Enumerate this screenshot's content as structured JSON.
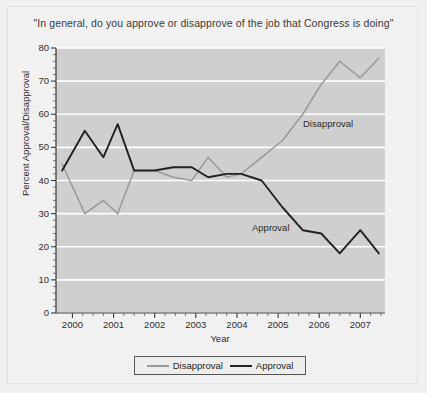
{
  "figure": {
    "background_color": "#f0f0f0",
    "plot_background_color": "#cfcfcf",
    "frame_border_color": "#e2e2e2"
  },
  "chart_data": {
    "type": "line",
    "title": "\"In general, do you approve or disapprove of the job that Congress is doing\"",
    "xlabel": "Year",
    "ylabel": "Percent Approval/Disapproval",
    "xlim": [
      1999.6,
      2007.6
    ],
    "ylim": [
      0,
      80
    ],
    "yticks": [
      0,
      10,
      20,
      30,
      40,
      50,
      60,
      70,
      80
    ],
    "ytick_labels": [
      "0",
      "10",
      "20",
      "30",
      "40",
      "50",
      "60",
      "70",
      "80"
    ],
    "xticks": [
      2000,
      2001,
      2002,
      2003,
      2004,
      2005,
      2006,
      2007
    ],
    "xtick_labels": [
      "2000",
      "2001",
      "2002",
      "2003",
      "2004",
      "2005",
      "2006",
      "2007"
    ],
    "grid": "horizontal-white",
    "minor_ticks": true,
    "legend_position": "below-axes",
    "series": [
      {
        "name": "Disapproval",
        "color": "#9a9a9a",
        "annotation": "Disapproval",
        "x": [
          1999.75,
          2000.3,
          2000.75,
          2001.1,
          2001.5,
          2002.0,
          2002.45,
          2002.9,
          2003.3,
          2003.75,
          2004.1,
          2004.6,
          2005.1,
          2005.6,
          2006.05,
          2006.5,
          2007.0,
          2007.45
        ],
        "values": [
          45,
          30,
          34,
          30,
          43,
          43,
          41,
          40,
          47,
          41,
          42,
          47,
          52,
          60,
          69,
          76,
          71,
          77
        ]
      },
      {
        "name": "Approval",
        "color": "#222222",
        "annotation": "Approval",
        "x": [
          1999.75,
          2000.3,
          2000.75,
          2001.1,
          2001.5,
          2002.0,
          2002.45,
          2002.9,
          2003.3,
          2003.75,
          2004.1,
          2004.6,
          2005.1,
          2005.6,
          2006.05,
          2006.5,
          2007.0,
          2007.45
        ],
        "values": [
          43,
          55,
          47,
          57,
          43,
          43,
          44,
          44,
          41,
          42,
          42,
          40,
          32,
          25,
          24,
          18,
          25,
          18
        ]
      }
    ]
  },
  "legend": {
    "items": [
      {
        "label": "Disapproval",
        "color": "#9a9a9a"
      },
      {
        "label": "Approval",
        "color": "#222222"
      }
    ]
  }
}
